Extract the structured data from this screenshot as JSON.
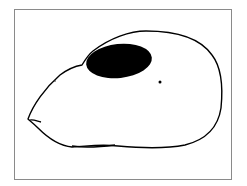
{
  "figure": {
    "frame_color": "#8a8a8a",
    "outline_color": "#000000",
    "eye_fill": "#000000",
    "background": "#ffffff"
  }
}
